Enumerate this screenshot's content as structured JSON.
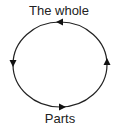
{
  "diagram": {
    "type": "cycle",
    "direction": "counterclockwise",
    "top_label": "The whole",
    "bottom_label": "Parts",
    "nodes": [
      "The whole",
      "Parts"
    ],
    "edges": [
      {
        "from": "The whole",
        "to": "Parts",
        "side": "left",
        "arrow": "down"
      },
      {
        "from": "Parts",
        "to": "The whole",
        "side": "right",
        "arrow": "up"
      }
    ],
    "stroke_color": "#222222"
  }
}
